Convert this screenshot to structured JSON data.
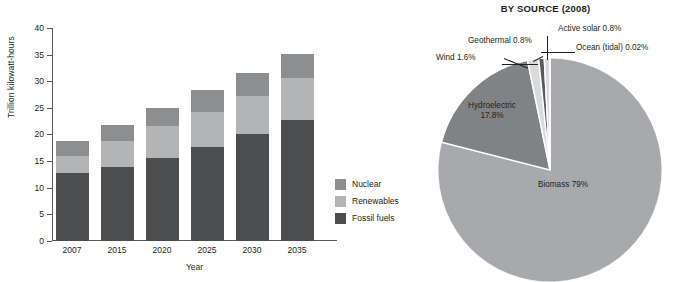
{
  "bar_chart_panel": {
    "y_axis_title": "Trillion kilowatt-hours",
    "x_axis_title": "Year",
    "legend": [
      {
        "label": "Nuclear",
        "color": "#8d8e90",
        "icon": "legend-swatch-icon"
      },
      {
        "label": "Renewables",
        "color": "#b3b4b6",
        "icon": "legend-swatch-icon"
      },
      {
        "label": "Fossil fuels",
        "color": "#4c4d4f",
        "icon": "legend-swatch-icon"
      }
    ]
  },
  "pie_chart_panel": {
    "title_line_1": "",
    "title_line_2": "BY SOURCE (2008)",
    "callouts": [
      {
        "label": "Geothermal 0.8%"
      },
      {
        "label": "Active solar 0.8%"
      },
      {
        "label": "Wind 1.6%"
      },
      {
        "label": "Ocean (tidal) 0.02%"
      }
    ],
    "inner_labels": [
      {
        "line_1": "Hydroelectric",
        "line_2": "17.8%"
      },
      {
        "line_1": "Biomass 79%",
        "line_2": ""
      }
    ]
  },
  "chart_data": [
    {
      "type": "bar",
      "subtype": "stacked",
      "title": "",
      "xlabel": "Year",
      "ylabel": "Trillion kilowatt-hours",
      "categories": [
        "2007",
        "2015",
        "2020",
        "2025",
        "2030",
        "2035"
      ],
      "ylim": [
        0,
        40
      ],
      "yticks": [
        0,
        5,
        10,
        15,
        20,
        25,
        30,
        35,
        40
      ],
      "grid": false,
      "legend_position": "right",
      "series": [
        {
          "name": "Fossil fuels",
          "color": "#4c4d4f",
          "values": [
            12.7,
            13.8,
            15.6,
            17.7,
            20.1,
            22.7
          ]
        },
        {
          "name": "Renewables",
          "color": "#b3b4b6",
          "values": [
            3.3,
            5.0,
            5.9,
            6.6,
            7.2,
            7.9
          ]
        },
        {
          "name": "Nuclear",
          "color": "#8d8e90",
          "values": [
            2.7,
            3.0,
            3.5,
            4.0,
            4.2,
            4.5
          ]
        }
      ],
      "totals": [
        18.7,
        21.8,
        25.0,
        28.3,
        31.5,
        35.1
      ]
    },
    {
      "type": "pie",
      "title": "BY SOURCE (2008)",
      "labels": [
        "Biomass",
        "Hydroelectric",
        "Wind",
        "Geothermal",
        "Active solar",
        "Ocean (tidal)"
      ],
      "values": [
        79,
        17.8,
        1.6,
        0.8,
        0.8,
        0.02
      ],
      "value_labels": [
        "Biomass 79%",
        "Hydroelectric 17.8%",
        "Wind 1.6%",
        "Geothermal 0.8%",
        "Active solar 0.8%",
        "Ocean (tidal) 0.02%"
      ],
      "colors": [
        "#a7a9ac",
        "#808285",
        "#d9dadb",
        "#58595b",
        "#d9dadb",
        "#58595b"
      ],
      "start_angle_deg": -90,
      "direction": "counterclockwise"
    }
  ]
}
